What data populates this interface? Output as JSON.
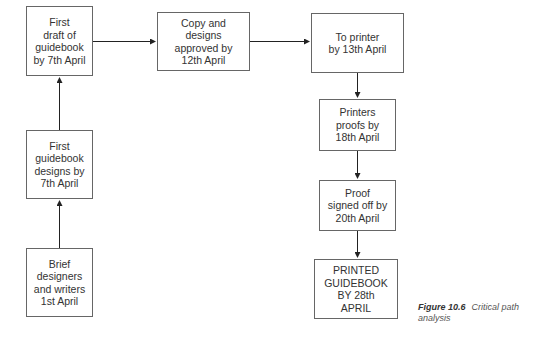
{
  "diagram": {
    "type": "critical-path-flowchart",
    "nodes": [
      {
        "id": "draft",
        "label": "First\ndraft of\nguidebook\nby 7th April"
      },
      {
        "id": "designs",
        "label": "First\nguidebook\ndesigns by\n7th April"
      },
      {
        "id": "brief",
        "label": "Brief\ndesigners\nand writers\n1st April"
      },
      {
        "id": "approved",
        "label": "Copy and\ndesigns\napproved by\n12th April"
      },
      {
        "id": "printer",
        "label": "To printer\nby 13th April"
      },
      {
        "id": "proofs",
        "label": "Printers\nproofs by\n18th April"
      },
      {
        "id": "signed",
        "label": "Proof\nsigned off by\n20th April"
      },
      {
        "id": "printed",
        "label": "PRINTED\nGUIDEBOOK\nBY 28th\nAPRIL"
      }
    ],
    "edges": [
      {
        "from": "brief",
        "to": "designs"
      },
      {
        "from": "designs",
        "to": "draft"
      },
      {
        "from": "draft",
        "to": "approved"
      },
      {
        "from": "approved",
        "to": "printer"
      },
      {
        "from": "printer",
        "to": "proofs"
      },
      {
        "from": "proofs",
        "to": "signed"
      },
      {
        "from": "signed",
        "to": "printed"
      }
    ]
  },
  "caption": {
    "number": "Figure 10.6",
    "text": "Critical path analysis"
  }
}
